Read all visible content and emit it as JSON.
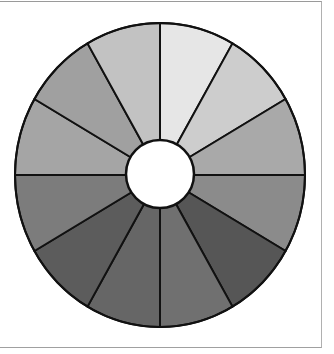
{
  "diagram": {
    "type": "segmented-wheel",
    "segment_count": 12,
    "center": {
      "x": 160,
      "y": 175
    },
    "outer_radius": {
      "rx": 145,
      "ry": 152
    },
    "inner_radius": 34,
    "stroke_color": "#111111",
    "hole_color": "#ffffff",
    "segments": [
      {
        "index": 1,
        "start_deg": 0,
        "end_deg": 30,
        "fill": "#e6e6e6"
      },
      {
        "index": 2,
        "start_deg": 30,
        "end_deg": 60,
        "fill": "#cdcdcd"
      },
      {
        "index": 3,
        "start_deg": 60,
        "end_deg": 90,
        "fill": "#a9a9a9"
      },
      {
        "index": 4,
        "start_deg": 90,
        "end_deg": 120,
        "fill": "#8b8b8b"
      },
      {
        "index": 5,
        "start_deg": 120,
        "end_deg": 150,
        "fill": "#565656"
      },
      {
        "index": 6,
        "start_deg": 150,
        "end_deg": 180,
        "fill": "#707070"
      },
      {
        "index": 7,
        "start_deg": 180,
        "end_deg": 210,
        "fill": "#666666"
      },
      {
        "index": 8,
        "start_deg": 210,
        "end_deg": 240,
        "fill": "#5c5c5c"
      },
      {
        "index": 9,
        "start_deg": 240,
        "end_deg": 270,
        "fill": "#7c7c7c"
      },
      {
        "index": 10,
        "start_deg": 270,
        "end_deg": 300,
        "fill": "#a5a5a5"
      },
      {
        "index": 11,
        "start_deg": 300,
        "end_deg": 330,
        "fill": "#a0a0a0"
      },
      {
        "index": 12,
        "start_deg": 330,
        "end_deg": 360,
        "fill": "#c2c2c2"
      }
    ]
  },
  "frame": {
    "border_color": "#a0a0a0"
  }
}
